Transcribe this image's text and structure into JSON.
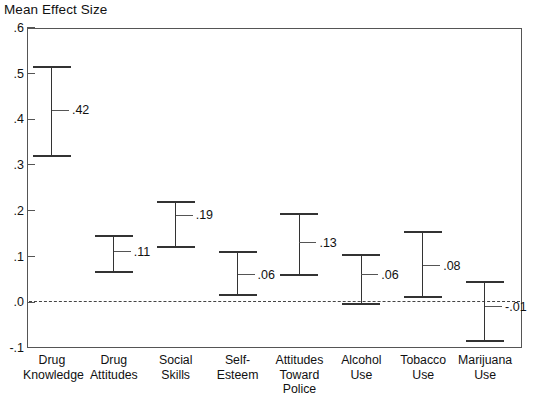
{
  "chart_data": {
    "type": "scatter",
    "title": "",
    "ylabel": "Mean Effect Size",
    "xlabel": "",
    "ylim": [
      -0.1,
      0.6
    ],
    "yticks": [
      0.6,
      0.5,
      0.4,
      0.3,
      0.2,
      0.1,
      0.0,
      -0.1
    ],
    "ytick_labels": [
      ".6",
      ".5",
      ".4",
      ".3",
      ".2",
      ".1",
      ".0",
      "-.1"
    ],
    "grid": false,
    "legend": null,
    "zero_reference_line": 0.0,
    "error_bar_style": "capped-vertical-range",
    "categories": [
      "Drug Knowledge",
      "Drug Attitudes",
      "Social Skills",
      "Self-Esteem",
      "Attitudes Toward Police",
      "Alcohol Use",
      "Tobacco Use",
      "Marijuana Use"
    ],
    "values": [
      0.42,
      0.11,
      0.19,
      0.06,
      0.13,
      0.06,
      0.08,
      -0.01
    ],
    "value_labels": [
      ".42",
      ".11",
      ".19",
      ".06",
      ".13",
      ".06",
      ".08",
      "-.01"
    ],
    "ci_lower": [
      0.32,
      0.065,
      0.12,
      0.015,
      0.06,
      -0.005,
      0.012,
      -0.085
    ],
    "ci_upper": [
      0.515,
      0.145,
      0.22,
      0.11,
      0.193,
      0.104,
      0.153,
      0.045
    ],
    "points": [
      {
        "category": "Drug Knowledge",
        "label_line1": "Drug",
        "label_line2": "Knowledge",
        "label_line3": "",
        "value": 0.42,
        "value_label": ".42",
        "ci_lower": 0.32,
        "ci_upper": 0.515
      },
      {
        "category": "Drug Attitudes",
        "label_line1": "Drug",
        "label_line2": "Attitudes",
        "label_line3": "",
        "value": 0.11,
        "value_label": ".11",
        "ci_lower": 0.065,
        "ci_upper": 0.145
      },
      {
        "category": "Social Skills",
        "label_line1": "Social",
        "label_line2": "Skills",
        "label_line3": "",
        "value": 0.19,
        "value_label": ".19",
        "ci_lower": 0.12,
        "ci_upper": 0.22
      },
      {
        "category": "Self-Esteem",
        "label_line1": "Self-",
        "label_line2": "Esteem",
        "label_line3": "",
        "value": 0.06,
        "value_label": ".06",
        "ci_lower": 0.015,
        "ci_upper": 0.11
      },
      {
        "category": "Attitudes Toward Police",
        "label_line1": "Attitudes",
        "label_line2": "Toward",
        "label_line3": "Police",
        "value": 0.13,
        "value_label": ".13",
        "ci_lower": 0.06,
        "ci_upper": 0.193
      },
      {
        "category": "Alcohol Use",
        "label_line1": "Alcohol",
        "label_line2": "Use",
        "label_line3": "",
        "value": 0.06,
        "value_label": ".06",
        "ci_lower": -0.005,
        "ci_upper": 0.104
      },
      {
        "category": "Tobacco Use",
        "label_line1": "Tobacco",
        "label_line2": "Use",
        "label_line3": "",
        "value": 0.08,
        "value_label": ".08",
        "ci_lower": 0.012,
        "ci_upper": 0.153
      },
      {
        "category": "Marijuana Use",
        "label_line1": "Marijuana",
        "label_line2": "Use",
        "label_line3": "",
        "value": -0.01,
        "value_label": "-.01",
        "ci_lower": -0.085,
        "ci_upper": 0.045
      }
    ]
  },
  "colors": {
    "background": "#ffffff",
    "axis": "#555555",
    "marker": "#333333",
    "text": "#111111",
    "zero_line": "#444444"
  }
}
